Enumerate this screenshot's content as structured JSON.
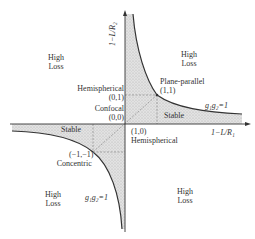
{
  "axes": {
    "x_label": "1−L/R₁",
    "y_label": "1−L/R₂"
  },
  "regions": {
    "high_loss_top_left": [
      "High",
      "Loss"
    ],
    "high_loss_top_right": [
      "High",
      "Loss"
    ],
    "high_loss_bottom_left": [
      "High",
      "Loss"
    ],
    "high_loss_bottom_right": [
      "High",
      "Loss"
    ],
    "stable_q1": "Stable",
    "stable_q3": "Stable"
  },
  "points": {
    "hemispherical_top": {
      "name": "Hemispherical",
      "coord": "(0,1)"
    },
    "confocal": {
      "name": "Confocal",
      "coord": "(0,0)"
    },
    "plane_parallel": {
      "name": "Plane-parallel",
      "coord": "(1,1)"
    },
    "hemispherical_right": {
      "name": "Hemispherical",
      "coord": "(1,0)"
    },
    "concentric": {
      "name": "Concentric",
      "coord": "(−1,−1)"
    }
  },
  "curves": {
    "upper_label": "g₁g₂=1",
    "lower_label": "g₁g₂=1"
  },
  "colors": {
    "stroke": "#333333",
    "shade": "#d8d8d8",
    "dash": "#888888"
  }
}
